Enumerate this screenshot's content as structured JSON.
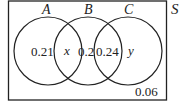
{
  "diagram": {
    "type": "venn",
    "universal_set_label": "S",
    "sets": [
      {
        "name": "A",
        "label": "A"
      },
      {
        "name": "B",
        "label": "B"
      },
      {
        "name": "C",
        "label": "C"
      }
    ],
    "regions": {
      "A_only": "0.21",
      "A_and_B_only": "x",
      "B_only": "0.2",
      "B_and_C_only": "0.24",
      "C_only": "y",
      "outside": "0.06"
    },
    "colors": {
      "stroke": "#222222",
      "background": "#ffffff"
    }
  }
}
